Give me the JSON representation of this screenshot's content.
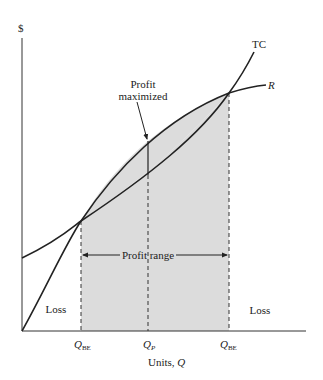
{
  "figure": {
    "y_axis_label": "$",
    "x_axis_label_prefix": "Units, ",
    "x_axis_label_var": "Q",
    "curves": {
      "total_cost_label": "TC",
      "revenue_label": "R"
    },
    "annotations": {
      "profit_max_line1": "Profit",
      "profit_max_line2": "maximized",
      "profit_range": "Profit range",
      "loss_left": "Loss",
      "loss_right": "Loss"
    },
    "x_ticks": [
      {
        "var": "Q",
        "sub": "BE"
      },
      {
        "var": "Q",
        "sub": "P"
      },
      {
        "var": "Q",
        "sub": "BE"
      }
    ],
    "colors": {
      "profit_fill": "#dcdcdc",
      "line": "#222222"
    }
  }
}
